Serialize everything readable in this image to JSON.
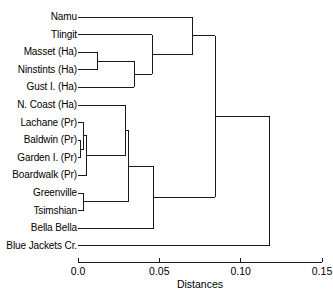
{
  "chart_data": {
    "type": "dendrogram",
    "title": "",
    "xlabel": "Distances",
    "ylabel": "",
    "xlim": [
      0.0,
      0.15
    ],
    "grid": false,
    "legend": "none",
    "orientation": "horizontal",
    "xticks": [
      {
        "value": 0.0,
        "label": "0.0"
      },
      {
        "value": 0.05,
        "label": "0.05"
      },
      {
        "value": 0.1,
        "label": "0.10"
      },
      {
        "value": 0.15,
        "label": "0.15"
      }
    ],
    "leaves": [
      {
        "index": 0,
        "label": "Namu"
      },
      {
        "index": 1,
        "label": "Tlingit"
      },
      {
        "index": 2,
        "label": "Masset (Ha)"
      },
      {
        "index": 3,
        "label": "Ninstints (Ha)"
      },
      {
        "index": 4,
        "label": "Gust I. (Ha)"
      },
      {
        "index": 5,
        "label": "N. Coast (Ha)"
      },
      {
        "index": 6,
        "label": "Lachane (Pr)"
      },
      {
        "index": 7,
        "label": "Baldwin (Pr)"
      },
      {
        "index": 8,
        "label": "Garden I. (Pr)"
      },
      {
        "index": 9,
        "label": "Boardwalk (Pr)"
      },
      {
        "index": 10,
        "label": "Greenville"
      },
      {
        "index": 11,
        "label": "Tsimshian"
      },
      {
        "index": 12,
        "label": "Bella Bella"
      },
      {
        "index": 13,
        "label": "Blue Jackets Cr."
      }
    ],
    "merges": [
      {
        "id": "m1",
        "height": 0.0015,
        "left": {
          "leaf": 7
        },
        "right": {
          "leaf": 8
        }
      },
      {
        "id": "m2",
        "height": 0.0035,
        "left": {
          "leaf": 6
        },
        "right": {
          "node": "m1"
        }
      },
      {
        "id": "m3",
        "height": 0.0035,
        "left": {
          "leaf": 10
        },
        "right": {
          "leaf": 11
        }
      },
      {
        "id": "m4",
        "height": 0.0055,
        "left": {
          "node": "m2"
        },
        "right": {
          "leaf": 9
        }
      },
      {
        "id": "m5",
        "height": 0.012,
        "left": {
          "leaf": 2
        },
        "right": {
          "leaf": 3
        }
      },
      {
        "id": "m6",
        "height": 0.029,
        "left": {
          "leaf": 5
        },
        "right": {
          "node": "m4"
        }
      },
      {
        "id": "m7",
        "height": 0.0345,
        "left": {
          "node": "m5"
        },
        "right": {
          "leaf": 4
        }
      },
      {
        "id": "m8",
        "height": 0.031,
        "left": {
          "node": "m6"
        },
        "right": {
          "node": "m3"
        }
      },
      {
        "id": "m9",
        "height": 0.0455,
        "left": {
          "leaf": 1
        },
        "right": {
          "node": "m7"
        }
      },
      {
        "id": "m10",
        "height": 0.0465,
        "left": {
          "node": "m8"
        },
        "right": {
          "leaf": 12
        }
      },
      {
        "id": "m11",
        "height": 0.0705,
        "left": {
          "leaf": 0
        },
        "right": {
          "node": "m9"
        }
      },
      {
        "id": "m12",
        "height": 0.0845,
        "left": {
          "node": "m11"
        },
        "right": {
          "node": "m10"
        }
      },
      {
        "id": "m13",
        "height": 0.118,
        "left": {
          "node": "m12"
        },
        "right": {
          "leaf": 13
        }
      }
    ]
  },
  "axis": {
    "title": "Distances",
    "tick_labels": [
      "0.0",
      "0.05",
      "0.10",
      "0.15"
    ]
  },
  "colors": {
    "line": "#000000",
    "text": "#000000",
    "background": "#ffffff"
  }
}
